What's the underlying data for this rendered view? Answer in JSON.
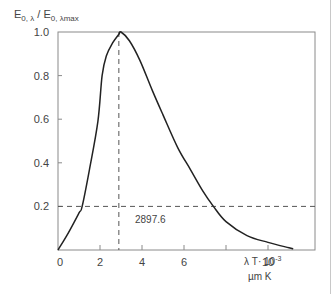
{
  "chart_data": {
    "type": "line",
    "title": "",
    "ylabel": "E0,λ / E0,λmax",
    "ylabel_parts": {
      "main": "E",
      "sub1": "0, λ",
      "sep": " / E",
      "sub2": "0, λmax"
    },
    "xlabel": "λ T· 10⁻³ µm K",
    "xlabel_line1": "λ T· 10",
    "xlabel_sup": "-3",
    "xlabel_line2": "µm K",
    "xlim": [
      0,
      12.4
    ],
    "ylim": [
      0,
      1.0
    ],
    "x_ticks": [
      "0",
      "2",
      "4",
      "6",
      "10"
    ],
    "x_tick_positions": [
      0,
      2,
      4,
      6,
      8,
      10
    ],
    "y_ticks": [
      "0.2",
      "0.4",
      "0.6",
      "0.8",
      "1.0"
    ],
    "grid": false,
    "series": [
      {
        "name": "Normalized spectral emissive power",
        "x": [
          0,
          0.5,
          1.0,
          1.15,
          1.5,
          1.9,
          2.1,
          2.3,
          2.6,
          2.9,
          3.0,
          3.4,
          3.9,
          4.5,
          5.0,
          5.7,
          6.3,
          6.9,
          7.4,
          8.0,
          9.0,
          10.0,
          11.0,
          11.2
        ],
        "y": [
          0.0,
          0.08,
          0.17,
          0.2,
          0.37,
          0.59,
          0.8,
          0.89,
          0.95,
          0.99,
          1.0,
          0.96,
          0.87,
          0.73,
          0.62,
          0.47,
          0.37,
          0.27,
          0.2,
          0.13,
          0.066,
          0.035,
          0.01,
          0.005
        ]
      }
    ],
    "annotations": [
      {
        "type": "vline",
        "x": 2.8976,
        "style": "dashed",
        "label": "2897.6"
      },
      {
        "type": "hline",
        "y": 0.2,
        "style": "dashed"
      }
    ],
    "annotation_label": "2897.6"
  }
}
